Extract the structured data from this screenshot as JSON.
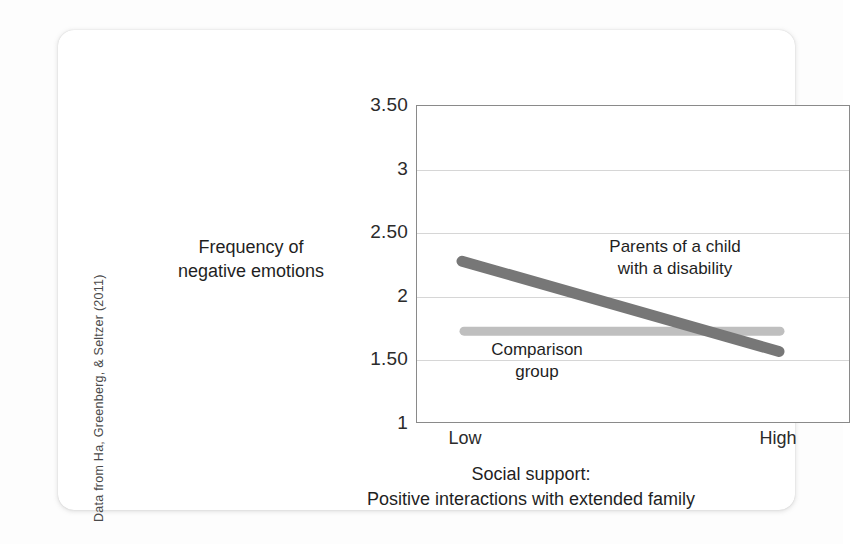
{
  "figure": {
    "source_credit": "Data from Ha, Greenberg, & Seltzer (2011)"
  },
  "chart_data": {
    "type": "line",
    "title": "",
    "xlabel": "Social support:\nPositive interactions with extended family",
    "xlabel_line1": "Social support:",
    "xlabel_line2": "Positive interactions with extended family",
    "ylabel": "Frequency of negative emotions",
    "ylabel_line1": "Frequency of",
    "ylabel_line2": "negative emotions",
    "x": [
      "Low",
      "High"
    ],
    "xtick_low": "Low",
    "xtick_high": "High",
    "ylim": [
      1,
      3.5
    ],
    "yticks": [
      1,
      1.5,
      2,
      2.5,
      3,
      3.5
    ],
    "ytick_labels": [
      "1",
      "1.50",
      "2",
      "2.50",
      "3",
      "3.50"
    ],
    "grid": true,
    "legend": "inline-annotations",
    "series": [
      {
        "name": "Parents of a child with a disability",
        "label_line1": "Parents of a child",
        "label_line2": "with a disability",
        "values": [
          2.28,
          1.57
        ],
        "color": "#777777",
        "width": 11
      },
      {
        "name": "Comparison group",
        "label_line1": "Comparison",
        "label_line2": "group",
        "values": [
          1.73,
          1.73
        ],
        "color": "#bfbfbf",
        "width": 9
      }
    ]
  },
  "colors": {
    "treatment_line": "#777777",
    "comparison_line": "#bfbfbf",
    "gridline": "#d6d6d6",
    "axis": "#8a8a8a",
    "text": "#1f1f1f",
    "card_background": "#ffffff",
    "page_background": "#fdfdfd"
  }
}
